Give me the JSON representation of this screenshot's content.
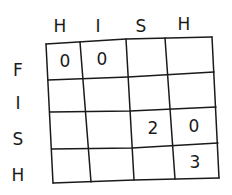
{
  "grid": {
    "column_labels": [
      "H",
      "I",
      "S",
      "H"
    ],
    "row_labels": [
      "F",
      "I",
      "S",
      "H"
    ],
    "cells": [
      [
        "0",
        "0",
        "",
        ""
      ],
      [
        "",
        "",
        "",
        ""
      ],
      [
        "",
        "",
        "2",
        "0"
      ],
      [
        "",
        "",
        "",
        "3"
      ]
    ]
  }
}
